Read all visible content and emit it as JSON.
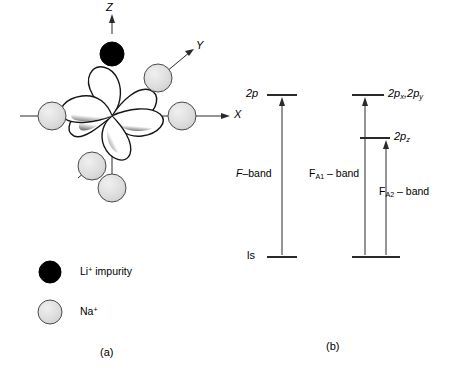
{
  "figure": {
    "panel_a": {
      "caption": "(a)",
      "axes": [
        {
          "name": "Z",
          "label": "Z",
          "direction": "up"
        },
        {
          "name": "Y",
          "label": "Y",
          "direction": "up-right-diagonal"
        },
        {
          "name": "X",
          "label": "X",
          "direction": "right"
        }
      ],
      "orbital": {
        "name": "p-like-orbital-lobes",
        "lobe_count": 6,
        "fill": "#ffffff",
        "edge_shading": "#1a1a1a"
      },
      "ions": [
        {
          "name": "li-impurity-ion",
          "position": "z-axis-top",
          "fill": "#000000"
        },
        {
          "name": "na-ion-upper-right",
          "position": "y-axis",
          "fill": "#dcdcdc"
        },
        {
          "name": "na-ion-left",
          "position": "x-axis-negative",
          "fill": "#dcdcdc"
        },
        {
          "name": "na-ion-right",
          "position": "x-axis-positive",
          "fill": "#dcdcdc"
        },
        {
          "name": "na-ion-lower-left",
          "position": "y-axis-negative",
          "fill": "#dcdcdc"
        },
        {
          "name": "na-ion-bottom",
          "position": "z-axis-bottom",
          "fill": "#dcdcdc"
        }
      ],
      "legend": [
        {
          "name": "li-impurity",
          "marker_fill": "#000000",
          "text_main": "Li",
          "text_sup": "+",
          "text_rest": " impurity"
        },
        {
          "name": "sodium-ion",
          "marker_fill": "#dcdcdc",
          "text_main": "Na",
          "text_sup": "+",
          "text_rest": ""
        }
      ]
    },
    "panel_b": {
      "caption": "(b)",
      "diagrams": [
        {
          "name": "f-center-levels",
          "upper_level_label": "2p",
          "lower_level_label": "ls",
          "band_label_main": "F",
          "band_label_rest": "–band"
        },
        {
          "name": "fa-center-levels",
          "upper_level_label_1": "2p",
          "upper_level_sub_1": "x",
          "upper_level_label_1b": ",2p",
          "upper_level_sub_1b": "y",
          "upper_level_label_2": "2p",
          "upper_level_sub_2": "z",
          "band_label_1_main": "F",
          "band_label_1_sub": "A1",
          "band_label_1_rest": " – band",
          "band_label_2_main": "F",
          "band_label_2_sub": "A2",
          "band_label_2_rest": " – band"
        }
      ]
    }
  },
  "colors": {
    "ink": "#000000",
    "ion_fill": "#dcdcdc",
    "ion_stroke": "#4a4a4a",
    "impurity_fill": "#000000",
    "line": "#2a2a2a"
  }
}
